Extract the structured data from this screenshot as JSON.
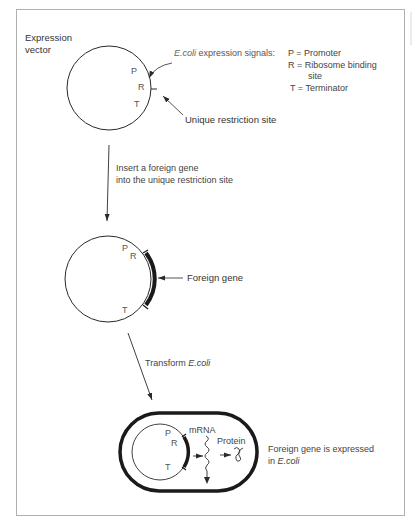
{
  "figure": {
    "colors": {
      "frame": "#b0b0b0",
      "line": "#2a2a2a",
      "text": "#333333",
      "signal_text": "#666666"
    },
    "step1": {
      "title_line1": "Expression",
      "title_line2": "vector",
      "signals_prefix": "E.coli",
      "signals_suffix": " expression signals:",
      "legend": [
        {
          "key": "P",
          "eq": "P = Promoter"
        },
        {
          "key": "R",
          "eq": "R = Ribosome binding"
        },
        {
          "key": "R-cont",
          "eq": "site"
        },
        {
          "key": "T",
          "eq": "T = Terminator"
        }
      ],
      "markers": {
        "p": "P",
        "r": "R",
        "t": "T"
      },
      "restriction_site": "Unique restriction site"
    },
    "arrow1": {
      "line1": "Insert a foreign gene",
      "line2": "into the unique restriction site"
    },
    "step2": {
      "markers": {
        "p": "P",
        "r": "R",
        "t": "T"
      },
      "foreign_gene": "Foreign gene"
    },
    "arrow2": {
      "prefix": "Transform ",
      "organism": "E.coli"
    },
    "step3": {
      "markers": {
        "p": "P",
        "r": "R",
        "t": "T"
      },
      "mrna": "mRNA",
      "protein": "Protein",
      "result_line1": "Foreign gene is expressed",
      "result_line2_prefix": "in ",
      "result_line2_organism": "E.coli"
    }
  }
}
